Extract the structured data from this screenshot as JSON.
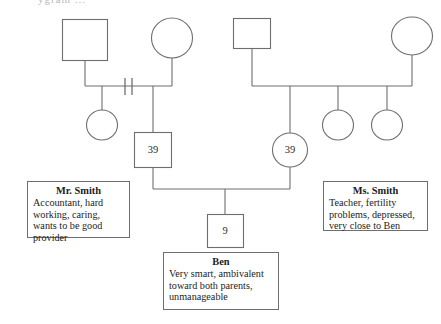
{
  "diagram": {
    "type": "genogram",
    "title_fragment": "ygram ...",
    "stroke_color": "#6e6e6e",
    "background_color": "#ffffff",
    "text_color": "#1c1c1c"
  },
  "people": {
    "paternal_grandfather": {
      "shape": "square",
      "label": "",
      "name": "paternal-grandfather"
    },
    "paternal_grandmother": {
      "shape": "circle",
      "label": "",
      "name": "paternal-grandmother"
    },
    "paternal_aunt": {
      "shape": "circle",
      "label": "",
      "name": "paternal-aunt"
    },
    "maternal_grandfather": {
      "shape": "square",
      "label": "",
      "name": "maternal-grandfather"
    },
    "maternal_grandmother": {
      "shape": "circle",
      "label": "",
      "name": "maternal-grandmother"
    },
    "maternal_sister_1": {
      "shape": "circle",
      "label": "",
      "name": "maternal-sister-1"
    },
    "maternal_sister_2": {
      "shape": "circle",
      "label": "",
      "name": "maternal-sister-2"
    },
    "father": {
      "shape": "square",
      "label": "39",
      "name": "father-mr-smith"
    },
    "mother": {
      "shape": "circle",
      "label": "39",
      "name": "mother-ms-smith"
    },
    "child": {
      "shape": "square",
      "label": "9",
      "name": "child-ben"
    }
  },
  "relationships": {
    "paternal_union_status": "divorced",
    "divorce_marks": 2
  },
  "notes": {
    "mr_smith": {
      "title": "Mr. Smith",
      "body": "Accountant, hard working, caring, wants to be good provider"
    },
    "ms_smith": {
      "title": "Ms. Smith",
      "body": "Teacher, fertility problems, depressed, very close to Ben"
    },
    "ben": {
      "title": "Ben",
      "body": "Very smart, ambivalent toward both parents, unmanageable"
    }
  }
}
